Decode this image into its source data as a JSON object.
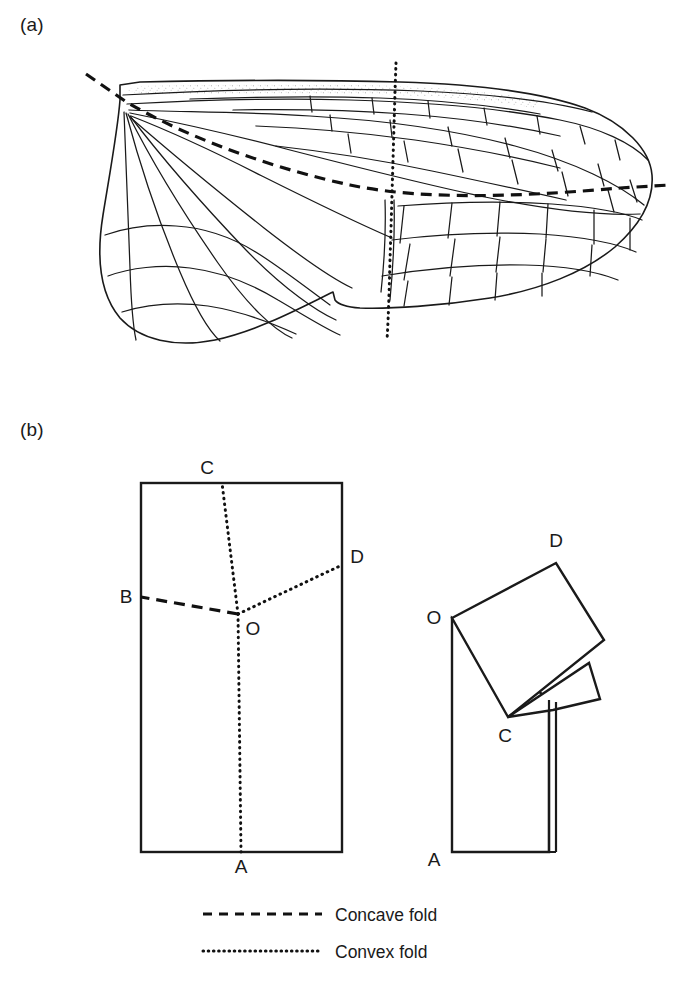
{
  "figure": {
    "panels": [
      {
        "id": "a",
        "label": "(a)",
        "caption": "",
        "description": "Insect hind wing outline with venation, anal fan, concave fold line and convex fold line"
      },
      {
        "id": "b",
        "label": "(b)",
        "caption": "",
        "description": "Paper-model schematic: flat rectangle with fold lines and the folded result"
      }
    ],
    "legend": {
      "items": [
        {
          "label": "Concave fold",
          "style": "dashed",
          "color": "#111111"
        },
        {
          "label": "Convex fold",
          "style": "dotted",
          "color": "#111111"
        }
      ]
    },
    "panel_b": {
      "flat_sheet": {
        "name": "flat-rectangle",
        "points": [
          {
            "id": "A",
            "label": "A",
            "role": "convex-fold-endpoint-bottom"
          },
          {
            "id": "B",
            "label": "B",
            "role": "concave-fold-endpoint-left"
          },
          {
            "id": "C",
            "label": "C",
            "role": "convex-fold-endpoint-top"
          },
          {
            "id": "D",
            "label": "D",
            "role": "convex-fold-endpoint-right"
          },
          {
            "id": "O",
            "label": "O",
            "role": "fold-junction-node"
          }
        ],
        "folds": [
          {
            "from": "O",
            "to": "A",
            "type": "convex"
          },
          {
            "from": "O",
            "to": "C",
            "type": "convex"
          },
          {
            "from": "O",
            "to": "D",
            "type": "convex"
          },
          {
            "from": "O",
            "to": "B",
            "type": "concave"
          }
        ]
      },
      "folded_sheet": {
        "name": "folded-result",
        "points": [
          {
            "id": "A",
            "label": "A"
          },
          {
            "id": "C",
            "label": "C"
          },
          {
            "id": "D",
            "label": "D"
          },
          {
            "id": "O",
            "label": "O"
          }
        ]
      }
    },
    "panel_a": {
      "folds": [
        {
          "name": "concave-fold-line",
          "type": "concave"
        },
        {
          "name": "convex-fold-line",
          "type": "convex"
        }
      ],
      "regions": [
        {
          "name": "costal-stipple-band"
        },
        {
          "name": "anal-fan"
        },
        {
          "name": "apical-cell-network"
        }
      ]
    },
    "colors": {
      "ink": "#1a1a1a",
      "fold": "#111111",
      "paper": "#ffffff"
    }
  }
}
